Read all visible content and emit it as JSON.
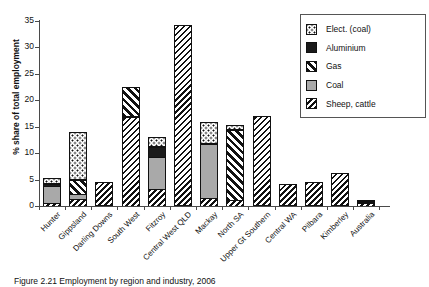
{
  "chart_data": {
    "type": "bar",
    "title": "",
    "xlabel": "",
    "ylabel": "% share of total employment",
    "ylim": [
      0,
      35
    ],
    "yticks": [
      0,
      5,
      10,
      15,
      20,
      25,
      30,
      35
    ],
    "grid": false,
    "stacked": true,
    "legend_position": "top-right",
    "categories": [
      "Hunter",
      "Gippsland",
      "Darling Downs",
      "South West",
      "Fitzroy",
      "Central West QLD",
      "Mackay",
      "North SA",
      "Upper Gt Southern",
      "Central WA",
      "Pilbara",
      "Kimberley",
      "Australia"
    ],
    "series": [
      {
        "name": "Sheep, cattle",
        "pattern": "sheep",
        "values": [
          0.6,
          1.3,
          4.6,
          16.8,
          3.2,
          34.2,
          1.5,
          1.1,
          17.0,
          4.1,
          4.5,
          6.2,
          0.9
        ]
      },
      {
        "name": "Coal",
        "pattern": "coal",
        "values": [
          3.1,
          1.0,
          0.0,
          0.0,
          6.1,
          0.0,
          10.3,
          0.0,
          0.0,
          0.0,
          0.0,
          0.0,
          0.1
        ]
      },
      {
        "name": "Gas",
        "pattern": "gas",
        "values": [
          0.0,
          2.6,
          0.0,
          5.7,
          0.0,
          0.0,
          0.0,
          13.3,
          0.0,
          0.0,
          0.0,
          0.0,
          0.0
        ]
      },
      {
        "name": "Aluminium",
        "pattern": "aluminium",
        "values": [
          0.5,
          0.0,
          0.0,
          0.0,
          1.9,
          0.0,
          0.0,
          0.0,
          0.0,
          0.0,
          0.0,
          0.0,
          0.0
        ]
      },
      {
        "name": "Elect. (coal)",
        "pattern": "elect",
        "values": [
          1.1,
          9.1,
          0.0,
          0.0,
          1.8,
          0.0,
          4.1,
          0.9,
          0.0,
          0.0,
          0.0,
          0.0,
          0.1
        ]
      }
    ],
    "totals": [
      5.3,
      14.0,
      4.6,
      22.5,
      13.0,
      34.2,
      15.9,
      15.3,
      17.0,
      4.1,
      4.5,
      6.2,
      1.1
    ]
  },
  "legend": {
    "items": [
      {
        "label": "Elect. (coal)",
        "pattern": "elect"
      },
      {
        "label": "Aluminium",
        "pattern": "aluminium"
      },
      {
        "label": "Gas",
        "pattern": "gas"
      },
      {
        "label": "Coal",
        "pattern": "coal"
      },
      {
        "label": "Sheep, cattle",
        "pattern": "sheep"
      }
    ]
  },
  "caption": {
    "text": "Figure 2.21 Employment by region and industry, 2006"
  }
}
